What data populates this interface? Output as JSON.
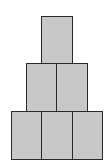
{
  "diagram": {
    "fill_color": "#c8c8c8",
    "stroke_color": "#2a2a2a",
    "rows": [
      {
        "row": 1,
        "count": 1
      },
      {
        "row": 2,
        "count": 2
      },
      {
        "row": 3,
        "count": 3
      }
    ],
    "total_blocks": 6
  }
}
